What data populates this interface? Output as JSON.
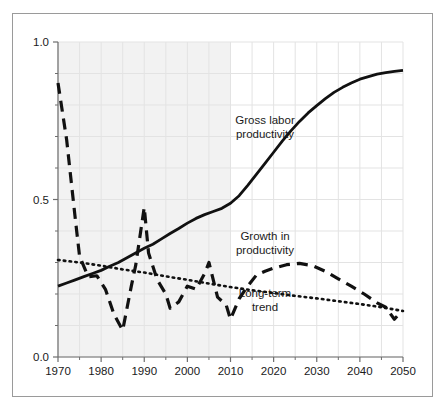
{
  "chart_data": {
    "type": "line",
    "title": "",
    "xlabel": "",
    "ylabel": "",
    "xlim": [
      1970,
      2050
    ],
    "ylim": [
      0.0,
      1.0
    ],
    "grid": true,
    "legend_position": "inline-annotations",
    "x_ticks_major": [
      "1970",
      "1980",
      "1990",
      "2000",
      "2010",
      "2020",
      "2030",
      "2040",
      "2050"
    ],
    "x_ticks_major_values": [
      1970,
      1980,
      1990,
      2000,
      2010,
      2020,
      2030,
      2040,
      2050
    ],
    "x_ticks_minor_values": [
      1975,
      1985,
      1995,
      2005,
      2015,
      2025,
      2035,
      2045
    ],
    "y_ticks_major": [
      "0.0",
      "0.5",
      "1.0"
    ],
    "y_ticks_major_values": [
      0.0,
      0.5,
      1.0
    ],
    "y_ticks_minor_values": [
      0.1,
      0.2,
      0.3,
      0.4,
      0.6,
      0.7,
      0.8,
      0.9
    ],
    "shaded_region": {
      "label": "historical",
      "x_start": 1970,
      "x_end": 2010,
      "color": "#f2f2f2"
    },
    "projection_region": {
      "label": "projection",
      "x_start": 2010,
      "x_end": 2050,
      "color": "#ffffff"
    },
    "series": [
      {
        "name": "Gross labor productivity",
        "style": "solid",
        "color": "#111111",
        "x": [
          1970,
          1972,
          1974,
          1976,
          1978,
          1980,
          1982,
          1984,
          1986,
          1988,
          1990,
          1992,
          1994,
          1996,
          1998,
          2000,
          2002,
          2004,
          2006,
          2008,
          2010,
          2012,
          2014,
          2016,
          2018,
          2020,
          2022,
          2024,
          2026,
          2028,
          2030,
          2032,
          2034,
          2036,
          2038,
          2040,
          2042,
          2044,
          2046,
          2048,
          2050
        ],
        "y": [
          0.225,
          0.235,
          0.245,
          0.255,
          0.265,
          0.275,
          0.288,
          0.3,
          0.315,
          0.33,
          0.345,
          0.358,
          0.375,
          0.392,
          0.408,
          0.425,
          0.44,
          0.452,
          0.462,
          0.472,
          0.488,
          0.512,
          0.545,
          0.58,
          0.615,
          0.65,
          0.685,
          0.718,
          0.748,
          0.775,
          0.798,
          0.82,
          0.84,
          0.856,
          0.87,
          0.882,
          0.89,
          0.898,
          0.903,
          0.907,
          0.91
        ]
      },
      {
        "name": "Growth in productivity",
        "style": "dashed",
        "color": "#111111",
        "x": [
          1970,
          1972,
          1974,
          1975,
          1977,
          1979,
          1981,
          1983,
          1985,
          1987,
          1988,
          1990,
          1991,
          1993,
          1995,
          1996,
          1998,
          2000,
          2002,
          2004,
          2005,
          2007,
          2009,
          2010,
          2012,
          2014,
          2016,
          2018,
          2020,
          2023,
          2026,
          2029,
          2032,
          2035,
          2038,
          2041,
          2044,
          2046,
          2048,
          2049
        ],
        "y": [
          0.87,
          0.69,
          0.44,
          0.32,
          0.255,
          0.258,
          0.215,
          0.135,
          0.085,
          0.225,
          0.29,
          0.475,
          0.33,
          0.245,
          0.2,
          0.155,
          0.175,
          0.225,
          0.215,
          0.265,
          0.3,
          0.19,
          0.165,
          0.12,
          0.185,
          0.225,
          0.26,
          0.272,
          0.282,
          0.293,
          0.297,
          0.29,
          0.272,
          0.248,
          0.225,
          0.2,
          0.172,
          0.158,
          0.12,
          0.135
        ]
      },
      {
        "name": "Long-term trend",
        "style": "dotted",
        "color": "#111111",
        "x": [
          1970,
          1975,
          1980,
          1985,
          1990,
          1995,
          2000,
          2005,
          2010,
          2015,
          2020,
          2025,
          2030,
          2035,
          2040,
          2045,
          2050
        ],
        "y": [
          0.308,
          0.3,
          0.29,
          0.278,
          0.268,
          0.256,
          0.245,
          0.233,
          0.222,
          0.212,
          0.203,
          0.194,
          0.186,
          0.177,
          0.168,
          0.158,
          0.146
        ]
      }
    ],
    "annotations": [
      {
        "text_line1": "Gross labor",
        "text_line2": "productivity",
        "x": 2018,
        "y": 0.74
      },
      {
        "text_line1": "Growth in",
        "text_line2": "productivity",
        "x": 2018,
        "y": 0.37
      },
      {
        "text_line1": "Long-term",
        "text_line2": "trend",
        "x": 2018,
        "y": 0.19
      }
    ]
  },
  "axis_labels": {
    "x": [
      "1970",
      "1980",
      "1990",
      "2000",
      "2010",
      "2020",
      "2030",
      "2040",
      "2050"
    ],
    "y": [
      "1.0",
      "0.5",
      "0.0"
    ]
  },
  "annotation_texts": {
    "gross_labor_1": "Gross labor",
    "gross_labor_2": "productivity",
    "growth_1": "Growth in",
    "growth_2": "productivity",
    "trend_1": "Long-term",
    "trend_2": "trend"
  },
  "colors": {
    "line": "#111111",
    "axis": "#6e6e6e",
    "grid": "#e3e3e3",
    "shade": "#f2f2f2",
    "frame": "#9a9a9a",
    "text": "#1a1a1a"
  }
}
